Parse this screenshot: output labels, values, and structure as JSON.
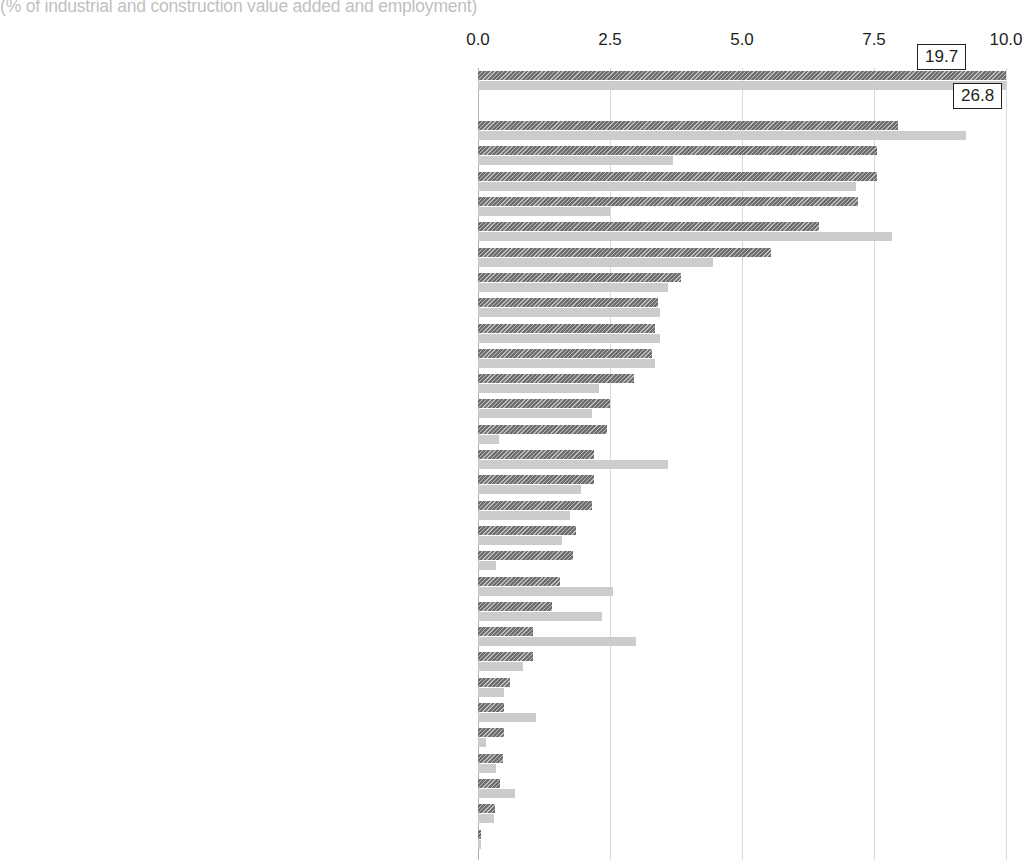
{
  "subtitle": "(% of industrial and construction value added and employment)",
  "chart_data": {
    "type": "bar",
    "orientation": "horizontal",
    "title": "",
    "subtitle": "(% of industrial and construction value added and employment)",
    "xlabel": "",
    "ylabel": "",
    "xlim": [
      0.0,
      10.0
    ],
    "xticks": [
      "0.0",
      "2.5",
      "5.0",
      "7.5",
      "10.0"
    ],
    "xtick_values": [
      0.0,
      2.5,
      5.0,
      7.5,
      10.0
    ],
    "grid": true,
    "legend": "none",
    "series": [
      {
        "name": "Value added",
        "color": "#6e6e6e",
        "hatch": "diagonal"
      },
      {
        "name": "Employment",
        "color": "#cccccc",
        "hatch": "none"
      }
    ],
    "categories": [
      "CONSTRUCTION (2)",
      "SELECTED INDUSTRIAL ACTIVITIES",
      "Food products & beverages",
      "Chemicals & chemical products",
      "Machinery & equipment n.e.c.",
      "Electricity, gas, steam & hot water supply (3)",
      "Fabricated metal products (3)",
      "Motor vehicles, trailers & semi-trailers (3)",
      "Publishing, printing, reproduction of recorded media (3)",
      "Rubber & plastic products (3)",
      "Electrical machinery & apparatus n.e.c.",
      "Other non-metallic mineral products",
      "Basic metals (3)",
      "Medical, precision & optical instruments, watches & clocks (4)",
      "Extraction of crude petroleum & natural gas (5)",
      "Furniture; manufacturing n.e.c. (3)",
      "Other transport equipment (3)",
      "Radio, TV & communication equipment",
      "Pulp, paper & paper products (3)",
      "Coke, refined petroleum products and nuclear fuel",
      "Wood products (3)",
      "Textiles (3)",
      "Wearing apparel; dressing; dyeing of fur (3)",
      "Collection, purification & distribution of water",
      "Other mining & quarrying",
      "Tanning, dressing of leather; manufacture of luggage",
      "Tobacco products (5)",
      "Office machinery & computers (4)",
      "Mining of coal & lignite; extraction of peat",
      "Recycling (3)",
      "Mining of metal ores (6)"
    ],
    "rows": [
      {
        "label": "CONSTRUCTION (2)",
        "value_added": 19.7,
        "employment": 26.8,
        "va_clipped": true,
        "emp_clipped": true,
        "callout_va": "19.7",
        "callout_emp": "26.8"
      },
      {
        "label": "SELECTED INDUSTRIAL ACTIVITIES",
        "value_added": null,
        "employment": null,
        "header": true
      },
      {
        "label": "Food products & beverages",
        "value_added": 7.95,
        "employment": 9.25
      },
      {
        "label": "Chemicals & chemical products",
        "value_added": 7.55,
        "employment": 3.7
      },
      {
        "label": "Machinery & equipment n.e.c.",
        "value_added": 7.55,
        "employment": 7.15
      },
      {
        "label": "Electricity, gas, steam & hot water supply (3)",
        "value_added": 7.2,
        "employment": 2.5
      },
      {
        "label": "Fabricated metal products (3)",
        "value_added": 6.45,
        "employment": 7.85
      },
      {
        "label": "Motor vehicles, trailers & semi-trailers (3)",
        "value_added": 5.55,
        "employment": 4.45
      },
      {
        "label": "Publishing, printing, reproduction of recorded media (3)",
        "value_added": 3.85,
        "employment": 3.6
      },
      {
        "label": "Rubber & plastic products (3)",
        "value_added": 3.4,
        "employment": 3.45
      },
      {
        "label": "Electrical machinery & apparatus n.e.c.",
        "value_added": 3.35,
        "employment": 3.45
      },
      {
        "label": "Other non-metallic mineral products",
        "value_added": 3.3,
        "employment": 3.35
      },
      {
        "label": "Basic metals (3)",
        "value_added": 2.95,
        "employment": 2.3
      },
      {
        "label": "Medical, precision & optical instruments, watches & clocks (4)",
        "value_added": 2.5,
        "employment": 2.15
      },
      {
        "label": "Extraction of crude petroleum & natural gas (5)",
        "value_added": 2.45,
        "employment": 0.4
      },
      {
        "label": "Furniture; manufacturing n.e.c. (3)",
        "value_added": 2.2,
        "employment": 3.6
      },
      {
        "label": "Other transport equipment (3)",
        "value_added": 2.2,
        "employment": 1.95
      },
      {
        "label": "Radio, TV & communication equipment",
        "value_added": 2.15,
        "employment": 1.75
      },
      {
        "label": "Pulp, paper & paper products (3)",
        "value_added": 1.85,
        "employment": 1.6
      },
      {
        "label": "Coke, refined petroleum products and nuclear fuel",
        "value_added": 1.8,
        "employment": 0.35
      },
      {
        "label": "Wood products (3)",
        "value_added": 1.55,
        "employment": 2.55
      },
      {
        "label": "Textiles (3)",
        "value_added": 1.4,
        "employment": 2.35
      },
      {
        "label": "Wearing apparel; dressing; dyeing of fur (3)",
        "value_added": 1.05,
        "employment": 3.0
      },
      {
        "label": "Collection, purification & distribution of water",
        "value_added": 1.05,
        "employment": 0.85
      },
      {
        "label": "Other mining & quarrying",
        "value_added": 0.6,
        "employment": 0.5
      },
      {
        "label": "Tanning, dressing of leather; manufacture of luggage",
        "value_added": 0.5,
        "employment": 1.1
      },
      {
        "label": "Tobacco products (5)",
        "value_added": 0.5,
        "employment": 0.15
      },
      {
        "label": "Office machinery & computers (4)",
        "value_added": 0.48,
        "employment": 0.35
      },
      {
        "label": "Mining of coal & lignite; extraction of peat",
        "value_added": 0.42,
        "employment": 0.7
      },
      {
        "label": "Recycling (3)",
        "value_added": 0.32,
        "employment": 0.3
      },
      {
        "label": "Mining of metal ores (6)",
        "value_added": 0.06,
        "employment": 0.05
      }
    ]
  }
}
